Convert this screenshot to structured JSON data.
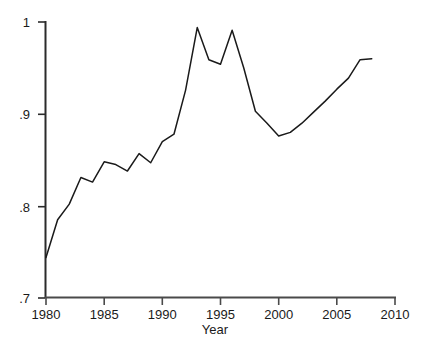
{
  "chart_data": {
    "type": "line",
    "title": "",
    "subtitle": "",
    "xlabel": "Year",
    "ylabel": "",
    "xlim": [
      1979.0,
      2010.0
    ],
    "ylim": [
      0.7,
      1.0
    ],
    "grid": false,
    "legend": null,
    "x_ticks": [
      1980,
      1985,
      1990,
      1995,
      2000,
      2005,
      2010
    ],
    "x_tick_labels": [
      "1980",
      "1985",
      "1990",
      "1995",
      "2000",
      "2005",
      "2010"
    ],
    "y_ticks": [
      0.7,
      0.8,
      0.9,
      1.0
    ],
    "y_tick_labels": [
      ".7",
      ".8",
      ".9",
      "1"
    ],
    "series": [
      {
        "name": "",
        "color": "#1a1a1a",
        "x": [
          1980,
          1981,
          1982,
          1983,
          1984,
          1985,
          1986,
          1987,
          1988,
          1989,
          1990,
          1991,
          1992,
          1993,
          1994,
          1995,
          1996,
          1997,
          1998,
          1999,
          2000,
          2001,
          2002,
          2003,
          2004,
          2005,
          2006,
          2007,
          2008
        ],
        "values": [
          0.744,
          0.785,
          0.802,
          0.831,
          0.826,
          0.848,
          0.845,
          0.838,
          0.857,
          0.847,
          0.87,
          0.878,
          0.926,
          0.994,
          0.959,
          0.954,
          0.991,
          0.95,
          0.903,
          0.89,
          0.876,
          0.88,
          0.89,
          0.902,
          0.914,
          0.927,
          0.939,
          0.959,
          0.96
        ]
      }
    ],
    "annotations": []
  },
  "axis": {
    "x_title": "Year"
  }
}
